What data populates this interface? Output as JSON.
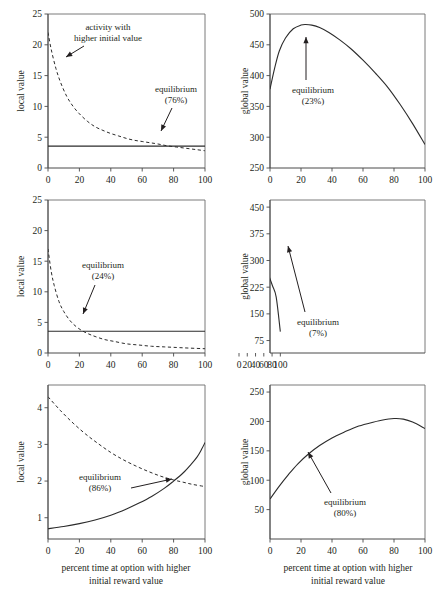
{
  "figure": {
    "title": "",
    "columns": 2,
    "rows": 3,
    "xcaption_left_line1": "percent time at option with higher",
    "xcaption_left_line2": "initial reward value",
    "xcaption_right_line1": "percent time at option with higher",
    "xcaption_right_line2": "initial reward value",
    "ink_color": "#231f20",
    "axis_color": "#4a4a4a"
  },
  "chart_data": [
    {
      "id": "panel-row1-local",
      "type": "line",
      "title": "",
      "xlabel": "percent time at option with higher initial reward value",
      "ylabel": "local value",
      "xlim": [
        0,
        100
      ],
      "ylim": [
        0,
        25
      ],
      "xticks": [
        0,
        20,
        40,
        60,
        80,
        100
      ],
      "yticks": [
        0,
        5,
        10,
        15,
        20,
        25
      ],
      "grid": false,
      "legend": "none",
      "annotations": [
        {
          "text_line1": "activity with",
          "text_line2": "higher initial value",
          "target_x": 8,
          "target_y": 14.2
        },
        {
          "text_line1": "equilibrium",
          "text_line2": "(76%)",
          "target_x": 76,
          "target_y": 3.6
        }
      ],
      "series": [
        {
          "name": "activity with higher initial value",
          "style": "dashed",
          "x": [
            0,
            2,
            5,
            8,
            12,
            16,
            20,
            25,
            30,
            35,
            40,
            45,
            50,
            55,
            60,
            65,
            70,
            76,
            82,
            88,
            94,
            100
          ],
          "values": [
            22.0,
            19.3,
            16.2,
            13.9,
            11.6,
            10.0,
            8.8,
            7.6,
            6.7,
            6.1,
            5.6,
            5.2,
            4.8,
            4.5,
            4.3,
            4.1,
            3.9,
            3.6,
            3.4,
            3.2,
            3.0,
            2.8
          ]
        },
        {
          "name": "equilibrium level",
          "style": "solid",
          "x": [
            0,
            100
          ],
          "values": [
            3.55,
            3.55
          ]
        }
      ]
    },
    {
      "id": "panel-row1-global",
      "type": "line",
      "title": "",
      "xlabel": "percent time at option with higher initial reward value",
      "ylabel": "global value",
      "xlim": [
        0,
        100
      ],
      "ylim": [
        250,
        500
      ],
      "xticks": [
        0,
        20,
        40,
        60,
        80,
        100
      ],
      "yticks": [
        250,
        300,
        350,
        400,
        450,
        500
      ],
      "grid": false,
      "legend": "none",
      "annotations": [
        {
          "text_line1": "equilibrium",
          "text_line2": "(23%)",
          "target_x": 23,
          "target_y": 483
        }
      ],
      "series": [
        {
          "name": "global value",
          "style": "solid",
          "x": [
            0,
            3,
            6,
            10,
            15,
            20,
            23,
            27,
            32,
            38,
            45,
            52,
            60,
            68,
            76,
            84,
            92,
            100
          ],
          "values": [
            378,
            412,
            440,
            461,
            476,
            482,
            483,
            482,
            478,
            470,
            458,
            444,
            425,
            404,
            381,
            353,
            322,
            288
          ]
        }
      ]
    },
    {
      "id": "panel-row2-local",
      "type": "line",
      "title": "",
      "xlabel": "percent time at option with higher initial reward value",
      "ylabel": "local value",
      "xlim": [
        0,
        100
      ],
      "ylim": [
        0,
        25
      ],
      "xticks": [
        0,
        20,
        40,
        60,
        80,
        100
      ],
      "yticks": [
        0,
        5,
        10,
        15,
        20,
        25
      ],
      "grid": false,
      "legend": "none",
      "annotations": [
        {
          "text_line1": "equilibrium",
          "text_line2": "(24%)",
          "target_x": 24,
          "target_y": 3.6
        }
      ],
      "series": [
        {
          "name": "activity with higher initial value",
          "style": "dashed",
          "x": [
            0,
            2,
            4,
            7,
            10,
            14,
            18,
            22,
            26,
            30,
            36,
            42,
            50,
            58,
            66,
            74,
            82,
            90,
            100
          ],
          "values": [
            17.0,
            13.4,
            11.0,
            8.4,
            6.8,
            5.3,
            4.3,
            3.6,
            3.1,
            2.7,
            2.2,
            1.9,
            1.5,
            1.3,
            1.1,
            1.0,
            0.9,
            0.8,
            0.7
          ]
        },
        {
          "name": "equilibrium level",
          "style": "solid",
          "x": [
            0,
            100
          ],
          "values": [
            3.55,
            3.55
          ]
        }
      ]
    },
    {
      "id": "panel-row2-global",
      "type": "line",
      "title": "",
      "xlabel": "percent time at option with higher initial reward value",
      "ylabel": "global value",
      "xlim": [
        75,
        450
      ],
      "ylim_display": [
        40,
        470
      ],
      "xticks": [
        0,
        20,
        40,
        60,
        80,
        100
      ],
      "yticks": [
        75,
        150,
        225,
        300,
        375,
        450
      ],
      "grid": false,
      "legend": "none",
      "annotations": [
        {
          "text_line1": "equilibrium",
          "text_line2": "(7%)",
          "target_x": 7,
          "target_y": 388
        }
      ],
      "series": [
        {
          "name": "global value",
          "style": "solid",
          "x": [
            0,
            2,
            4,
            7,
            10,
            15,
            20,
            28,
            36,
            45,
            54,
            63,
            72,
            81,
            90,
            100
          ],
          "values": [
            375,
            384,
            389,
            391,
            390,
            386,
            380,
            367,
            351,
            331,
            309,
            285,
            258,
            229,
            197,
            100
          ]
        }
      ]
    },
    {
      "id": "panel-row3-local",
      "type": "line",
      "title": "",
      "xlabel": "percent time at option with higher initial reward value",
      "ylabel": "local value",
      "xlim": [
        0,
        100
      ],
      "ylim": [
        0.4,
        4.6
      ],
      "xticks": [
        0,
        20,
        40,
        60,
        80,
        100
      ],
      "yticks": [
        1,
        2,
        3,
        4
      ],
      "grid": false,
      "legend": "none",
      "annotations": [
        {
          "text_line1": "equilibrium",
          "text_line2": "(86%)",
          "target_x": 86,
          "target_y": 2.0
        }
      ],
      "series": [
        {
          "name": "activity with higher initial value",
          "style": "dashed",
          "x": [
            0,
            8,
            16,
            24,
            32,
            40,
            48,
            56,
            64,
            72,
            80,
            86,
            92,
            100
          ],
          "values": [
            4.3,
            3.92,
            3.58,
            3.28,
            3.02,
            2.78,
            2.58,
            2.41,
            2.26,
            2.13,
            2.03,
            1.97,
            1.91,
            1.85
          ]
        },
        {
          "name": "other activity",
          "style": "solid",
          "x": [
            0,
            10,
            20,
            30,
            40,
            50,
            58,
            66,
            74,
            80,
            86,
            91,
            95,
            98,
            100
          ],
          "values": [
            0.7,
            0.76,
            0.84,
            0.94,
            1.07,
            1.24,
            1.4,
            1.58,
            1.8,
            2.0,
            2.22,
            2.45,
            2.66,
            2.88,
            3.05
          ]
        }
      ]
    },
    {
      "id": "panel-row3-global",
      "type": "line",
      "title": "",
      "xlabel": "percent time at option with higher initial reward value",
      "ylabel": "global value",
      "xlim": [
        0,
        100
      ],
      "ylim": [
        0,
        262
      ],
      "xticks": [
        0,
        20,
        40,
        60,
        80,
        100
      ],
      "yticks": [
        50,
        100,
        150,
        200,
        250
      ],
      "grid": false,
      "legend": "none",
      "annotations": [
        {
          "text_line1": "equilibrium",
          "text_line2": "(80%)",
          "target_x": 80,
          "target_y": 204
        }
      ],
      "series": [
        {
          "name": "global value",
          "style": "solid",
          "x": [
            0,
            6,
            12,
            18,
            25,
            32,
            40,
            48,
            56,
            64,
            72,
            80,
            86,
            92,
            100
          ],
          "values": [
            68,
            90,
            110,
            128,
            145,
            159,
            172,
            182,
            191,
            197,
            202,
            205,
            204,
            199,
            188
          ]
        }
      ]
    }
  ],
  "labels": {
    "local_value": "local value",
    "global_value": "global value",
    "activity_line1": "activity with",
    "activity_line2": "higher initial value",
    "equilibrium": "equilibrium",
    "eq_76": "(76%)",
    "eq_23": "(23%)",
    "eq_24": "(24%)",
    "eq_7": "(7%)",
    "eq_86": "(86%)",
    "eq_80": "(80%)"
  }
}
